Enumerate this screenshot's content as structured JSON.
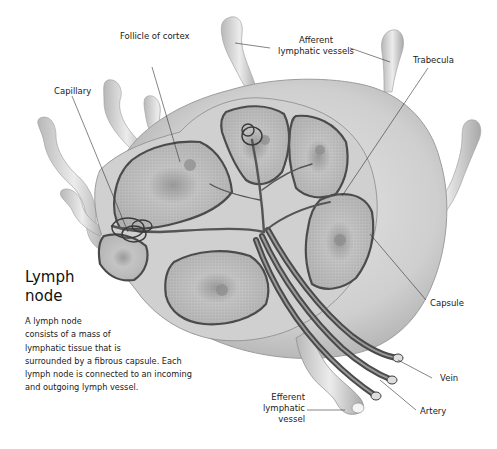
{
  "title": {
    "line1": "Lymph",
    "line2": "node"
  },
  "description": {
    "lines": [
      "A lymph node",
      "consists of a mass of",
      "lymphatic tissue that is",
      "surrounded by a fibrous capsule. Each",
      "lymph node is connected to an incoming",
      "and outgoing lymph vessel."
    ]
  },
  "labels": {
    "follicle": "Follicle of cortex",
    "afferent_line1": "Afferent",
    "afferent_line2": "lymphatic vessels",
    "trabecula": "Trabecula",
    "capillary": "Capillary",
    "capsule": "Capsule",
    "vein": "Vein",
    "artery": "Artery",
    "efferent_line1": "Efferent",
    "efferent_line2": "lymphatic",
    "efferent_line3": "vessel"
  },
  "colors": {
    "background": "#ffffff",
    "capsule_fill": "#d6d6d6",
    "follicle_fill": "#bdbdbd",
    "follicle_border": "#4a4a4a",
    "vessel_fill": "#cfcfcf",
    "blood_vessel": "#555555",
    "leader_line": "#333333"
  }
}
